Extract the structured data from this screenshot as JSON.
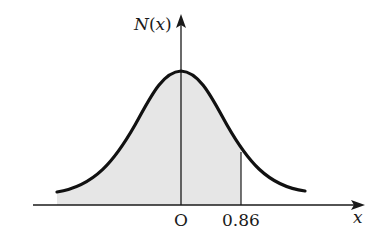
{
  "diagram": {
    "type": "normal-distribution-curve",
    "y_axis_label": "N(x)",
    "y_axis_label_func": "N",
    "y_axis_label_var": "x",
    "x_axis_label": "x",
    "origin_label": "O",
    "marker_label": "0.86",
    "marker_value": 0.86,
    "shaded_region": "area under curve from left tail up to x = 0.86",
    "colors": {
      "curve": "#111111",
      "axes": "#1a1a1a",
      "shade": "#e6e6e6"
    }
  }
}
